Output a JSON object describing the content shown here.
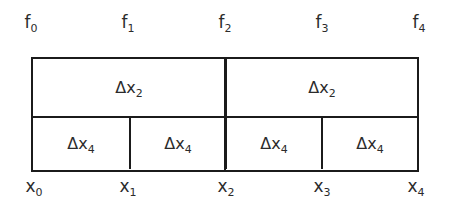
{
  "figure": {
    "name": "composite-interval-subdivision-diagram",
    "background_color": "#ffffff",
    "line_color": "#1b1b1b",
    "text_color": "#2b2b2b"
  },
  "top_labels": [
    {
      "base": "f",
      "sub": "0",
      "position_pct": 0
    },
    {
      "base": "f",
      "sub": "1",
      "position_pct": 25
    },
    {
      "base": "f",
      "sub": "2",
      "position_pct": 50
    },
    {
      "base": "f",
      "sub": "3",
      "position_pct": 75
    },
    {
      "base": "f",
      "sub": "4",
      "position_pct": 100
    }
  ],
  "bottom_labels": [
    {
      "base": "x",
      "sub": "0",
      "position_pct": 0
    },
    {
      "base": "x",
      "sub": "1",
      "position_pct": 25
    },
    {
      "base": "x",
      "sub": "2",
      "position_pct": 50
    },
    {
      "base": "x",
      "sub": "3",
      "position_pct": 75
    },
    {
      "base": "x",
      "sub": "4",
      "position_pct": 100
    }
  ],
  "rows": {
    "top": {
      "name": "coarse-row",
      "cells": [
        {
          "base": "Δx",
          "sub": "2"
        },
        {
          "base": "Δx",
          "sub": "2"
        }
      ]
    },
    "bottom": {
      "name": "fine-row",
      "cells": [
        {
          "base": "Δx",
          "sub": "4"
        },
        {
          "base": "Δx",
          "sub": "4"
        },
        {
          "base": "Δx",
          "sub": "4"
        },
        {
          "base": "Δx",
          "sub": "4"
        }
      ]
    }
  }
}
